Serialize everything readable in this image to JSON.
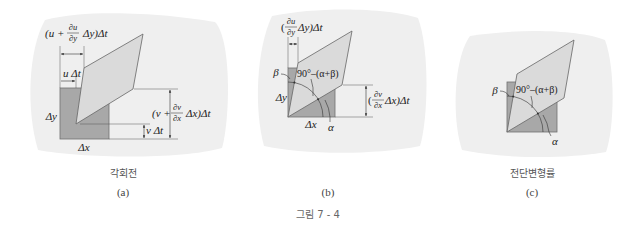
{
  "figure": {
    "caption": "그림 7 - 4"
  },
  "colors": {
    "blob": "#efefef",
    "square_fill": "#a8a8a8",
    "parallelogram_fill": "#dadada",
    "outline": "#666666",
    "text": "#222222"
  },
  "panels": [
    {
      "id": "a",
      "subtitle": "각회전",
      "label": "(a)",
      "labels": {
        "top_dim": {
          "prefix": "(u +",
          "num": "∂u",
          "den": "∂y",
          "suffix": "Δy)Δt"
        },
        "u_dt": "u Δt",
        "right_dim": {
          "prefix": "(v +",
          "num": "∂v",
          "den": "∂x",
          "suffix": "Δx)Δt"
        },
        "v_dt": "v Δt",
        "dy": "Δy",
        "dx": "Δx"
      }
    },
    {
      "id": "b",
      "subtitle": "",
      "label": "(b)",
      "labels": {
        "top_dim": {
          "prefix": "(",
          "num": "∂u",
          "den": "∂y",
          "suffix": "Δy)Δt"
        },
        "right_dim": {
          "prefix": "(",
          "num": "∂v",
          "den": "∂x",
          "suffix": "Δx)Δt"
        },
        "beta": "β",
        "angle": "90°–(α+β)",
        "alpha": "α",
        "dy": "Δy",
        "dx": "Δx"
      }
    },
    {
      "id": "c",
      "subtitle": "전단변형률",
      "label": "(c)",
      "labels": {
        "beta": "β",
        "angle": "90°–(α+β)",
        "alpha": "α"
      }
    }
  ]
}
